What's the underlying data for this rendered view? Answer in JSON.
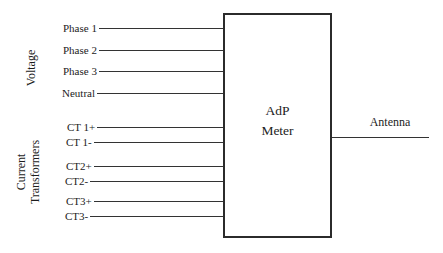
{
  "diagram": {
    "background_color": "#ffffff",
    "line_color": "#333333",
    "text_color": "#1c1c1c",
    "voltage_group": {
      "label": "Voltage",
      "inputs": [
        "Phase 1",
        "Phase 2",
        "Phase 3",
        "Neutral"
      ]
    },
    "ct_group": {
      "label_line1": "Current",
      "label_line2": "Transformers",
      "inputs": [
        "CT 1+",
        "CT 1-",
        "CT2+",
        "CT2-",
        "CT3+",
        "CT3-"
      ]
    },
    "meter": {
      "label_line1": "AdP",
      "label_line2": "Meter"
    },
    "antenna_label": "Antenna"
  }
}
